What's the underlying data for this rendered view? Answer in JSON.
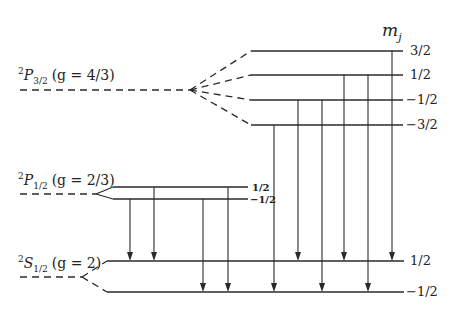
{
  "title_axis": {
    "label": "m",
    "sub": "j",
    "x": 382,
    "y": 36
  },
  "colors": {
    "line": "#2a2a2a",
    "background": "#ffffff"
  },
  "terms": [
    {
      "id": "P32",
      "sup": "2",
      "letter": "P",
      "sub": "3/2",
      "gfactor": "(g = 4/3)",
      "label_x": 18,
      "label_y": 80,
      "dash": {
        "x1": 20,
        "x2": 190,
        "y": 90
      }
    },
    {
      "id": "P12",
      "sup": "2",
      "letter": "P",
      "sub": "1/2",
      "gfactor": "(g = 2/3)",
      "label_x": 18,
      "label_y": 185,
      "dash": {
        "x1": 20,
        "x2": 96,
        "y": 194
      }
    },
    {
      "id": "S12",
      "sup": "2",
      "letter": "S",
      "sub": "1/2",
      "gfactor": "(g = 2)",
      "label_x": 18,
      "label_y": 268,
      "dash": {
        "x1": 20,
        "x2": 82,
        "y": 277
      }
    }
  ],
  "levels": [
    {
      "term": "P32",
      "mj": "3/2",
      "y": 51,
      "x1": 251,
      "x2": 403,
      "label_x": 410,
      "small": false
    },
    {
      "term": "P32",
      "mj": "1/2",
      "y": 75,
      "x1": 251,
      "x2": 403,
      "label_x": 410,
      "small": false
    },
    {
      "term": "P32",
      "mj": "−1/2",
      "y": 100,
      "x1": 251,
      "x2": 403,
      "label_x": 406,
      "small": false
    },
    {
      "term": "P32",
      "mj": "−3/2",
      "y": 125,
      "x1": 251,
      "x2": 403,
      "label_x": 406,
      "small": false
    },
    {
      "term": "P12",
      "mj": "1/2",
      "y": 187,
      "x1": 113,
      "x2": 248,
      "label_x": 252,
      "small": true
    },
    {
      "term": "P12",
      "mj": "−1/2",
      "y": 199,
      "x1": 113,
      "x2": 248,
      "label_x": 250,
      "small": true
    },
    {
      "term": "S12",
      "mj": "1/2",
      "y": 261,
      "x1": 107,
      "x2": 404,
      "label_x": 410,
      "small": false
    },
    {
      "term": "S12",
      "mj": "−1/2",
      "y": 292,
      "x1": 107,
      "x2": 404,
      "label_x": 406,
      "small": false
    }
  ],
  "splits": [
    {
      "from": [
        190,
        90
      ],
      "to": [
        [
          251,
          51
        ],
        [
          251,
          75
        ],
        [
          251,
          100
        ],
        [
          251,
          125
        ]
      ],
      "style": "dashed"
    },
    {
      "from": [
        96,
        194
      ],
      "to": [
        [
          113,
          187
        ],
        [
          113,
          199
        ]
      ],
      "style": "solid"
    },
    {
      "from": [
        82,
        277
      ],
      "to": [
        [
          107,
          261
        ],
        [
          107,
          292
        ]
      ],
      "style": "dashed"
    }
  ],
  "transitions": [
    {
      "from_mj": "1/2 (P1/2)",
      "to_mj": "1/2 (S1/2)",
      "x": 154,
      "y1": 187,
      "y2": 261
    },
    {
      "from_mj": "-1/2 (P1/2)",
      "to_mj": "1/2 (S1/2)",
      "x": 130,
      "y1": 199,
      "y2": 261
    },
    {
      "from_mj": "-1/2 (P1/2)",
      "to_mj": "-1/2 (S1/2)",
      "x": 203,
      "y1": 199,
      "y2": 292
    },
    {
      "from_mj": "1/2 (P1/2)",
      "to_mj": "-1/2 (S1/2)",
      "x": 228,
      "y1": 187,
      "y2": 292
    },
    {
      "from_mj": "-3/2",
      "to_mj": "-1/2",
      "x": 274,
      "y1": 125,
      "y2": 292
    },
    {
      "from_mj": "-1/2",
      "to_mj": "1/2",
      "x": 298,
      "y1": 100,
      "y2": 261
    },
    {
      "from_mj": "-1/2",
      "to_mj": "-1/2",
      "x": 322,
      "y1": 100,
      "y2": 292
    },
    {
      "from_mj": "1/2",
      "to_mj": "1/2",
      "x": 344,
      "y1": 75,
      "y2": 261
    },
    {
      "from_mj": "1/2",
      "to_mj": "-1/2",
      "x": 368,
      "y1": 75,
      "y2": 292
    },
    {
      "from_mj": "3/2",
      "to_mj": "1/2",
      "x": 392,
      "y1": 51,
      "y2": 261
    }
  ]
}
